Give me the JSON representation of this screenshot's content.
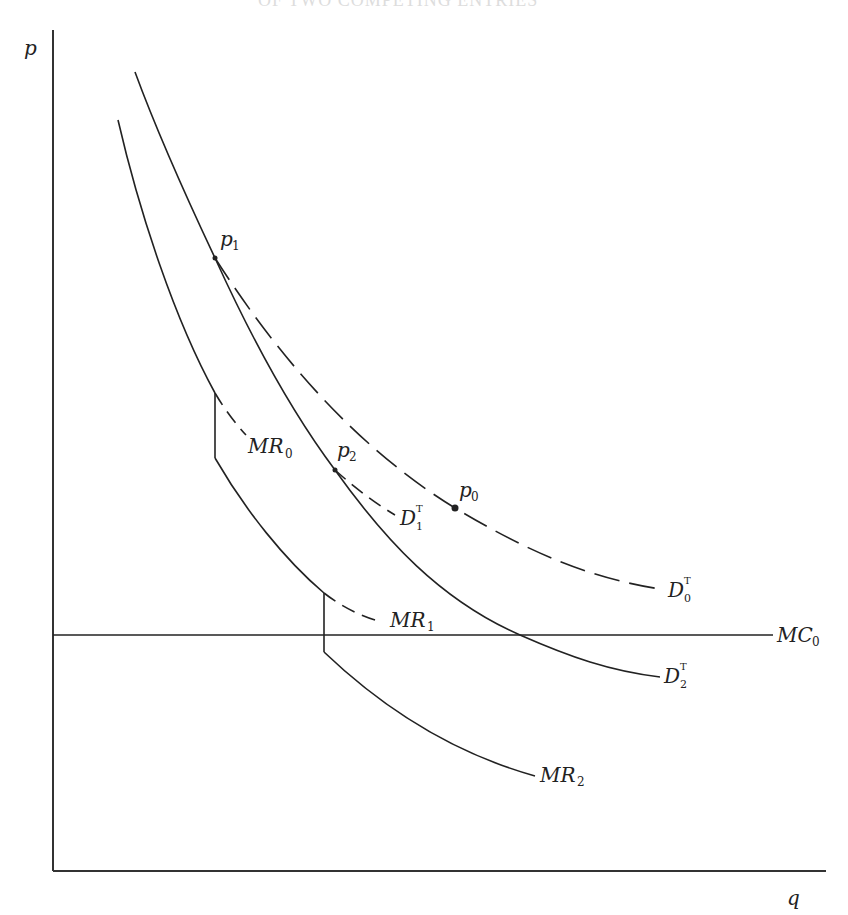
{
  "header": {
    "text": "OF TWO COMPETING ENTRIES"
  },
  "axes": {
    "y_label": "p",
    "x_label": "q"
  },
  "curves": {
    "D0T": {
      "name": "D",
      "sub": "0",
      "sup": "T",
      "style": "dashed"
    },
    "D1T": {
      "name": "D",
      "sub": "1",
      "sup": "T",
      "style": "dashed"
    },
    "D2T": {
      "name": "D",
      "sub": "2",
      "sup": "T",
      "style": "solid"
    },
    "MR0": {
      "name": "MR",
      "sub": "0",
      "style": "dashed"
    },
    "MR1": {
      "name": "MR",
      "sub": "1",
      "style": "solid+dashed"
    },
    "MR2": {
      "name": "MR",
      "sub": "2",
      "style": "solid"
    },
    "MC0": {
      "name": "MC",
      "sub": "0",
      "style": "solid"
    }
  },
  "points": {
    "p0": {
      "name": "p",
      "sub": "0"
    },
    "p1": {
      "name": "p",
      "sub": "1"
    },
    "p2": {
      "name": "p",
      "sub": "2"
    }
  },
  "colors": {
    "line": "#222222",
    "background": "#ffffff"
  }
}
